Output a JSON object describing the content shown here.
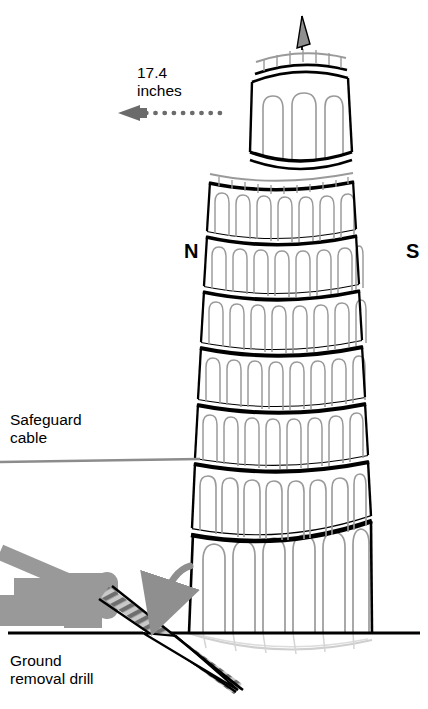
{
  "figure": {
    "type": "technical-illustration",
    "background_color": "#ffffff"
  },
  "labels": {
    "measurement": "17.4\ninches",
    "measurement_value": "17.4",
    "measurement_unit": "inches",
    "compass_north": "N",
    "compass_south": "S",
    "safeguard_cable": "Safeguard\ncable",
    "ground_removal_drill": "Ground\nremoval drill"
  },
  "colors": {
    "outline": "#000000",
    "arcade_gray": "#9a9a9a",
    "arrow_gray": "#6b6b6b",
    "machine_gray": "#999999",
    "cable_gray": "#8c8c8c",
    "shadow_gray": "#cccccc",
    "flag_gray": "#8c8c8c"
  },
  "annotations": {
    "dotted_arrow_direction": "left",
    "dotted_arrow_dots": 13,
    "curved_arrow_direction": "down-left",
    "tower_lean_direction": "south",
    "tower_tiers": 8
  }
}
